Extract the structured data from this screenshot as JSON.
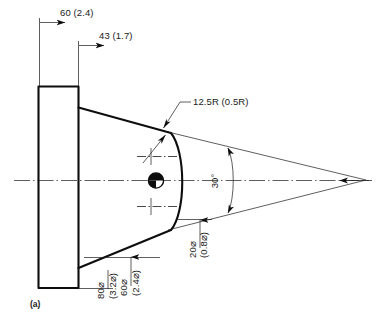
{
  "figure": {
    "label": "(a)",
    "type": "engineering-drawing",
    "view": "cross-section of conical nozzle / spray tip",
    "background_color": "#ffffff",
    "line_color": "#0d0d0d"
  },
  "dimensions": {
    "top_overall": {
      "name": "overall-length",
      "text": "60 (2.4)",
      "metric": "60",
      "imperial": "2.4"
    },
    "top_secondary": {
      "name": "taper-length",
      "text": "43 (1.7)",
      "metric": "43",
      "imperial": "1.7"
    },
    "radius_leader": {
      "name": "corner-radius",
      "text": "12.5R (0.5R)",
      "metric": "12.5R",
      "imperial": "0.5R"
    },
    "angle": {
      "name": "included-angle",
      "text": "30°",
      "value": "30",
      "unit": "degrees"
    },
    "throat_diameter": {
      "name": "throat-diameter",
      "text_metric": "20⌀",
      "text_imperial": "(0.8⌀)"
    },
    "flange_diameter": {
      "name": "flange-diameter",
      "text_metric": "80⌀",
      "text_imperial": "(3.2⌀)"
    },
    "body_diameter": {
      "name": "body-diameter",
      "text_metric": "60⌀",
      "text_imperial": "(2.4⌀)"
    }
  }
}
